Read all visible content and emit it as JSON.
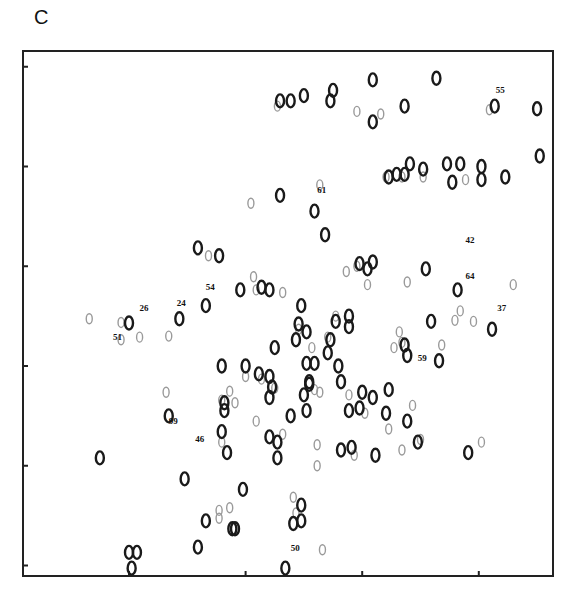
{
  "panel_label": "C",
  "chart_data": {
    "type": "scatter",
    "title": "",
    "subtitle": "2D NMR spectrum overlay (two conditions)",
    "xlabel": "",
    "ylabel": "",
    "xlim": [
      0,
      100
    ],
    "ylim": [
      0,
      100
    ],
    "x_ticks": [
      20,
      42,
      64,
      86
    ],
    "y_ticks": [
      2,
      21,
      40,
      59,
      78,
      97
    ],
    "tick_labels_shown": false,
    "grid": false,
    "legend": "none",
    "series": [
      {
        "name": "reference (dark contours)",
        "color": "#1a1a1a",
        "points": [
          [
            48.5,
            90.5
          ],
          [
            50.5,
            90.5
          ],
          [
            53,
            91.5
          ],
          [
            58.5,
            92.5
          ],
          [
            58,
            90.5
          ],
          [
            66,
            94.5
          ],
          [
            78,
            94.8
          ],
          [
            72,
            89.5
          ],
          [
            66,
            86.5
          ],
          [
            89,
            89.5
          ],
          [
            97,
            89
          ],
          [
            73,
            78.5
          ],
          [
            72,
            76.5
          ],
          [
            69,
            76
          ],
          [
            70.5,
            76.5
          ],
          [
            75.5,
            77.5
          ],
          [
            80,
            78.5
          ],
          [
            82.5,
            78.5
          ],
          [
            86.5,
            78
          ],
          [
            86.5,
            75.5
          ],
          [
            91,
            76
          ],
          [
            97.5,
            80
          ],
          [
            81,
            75
          ],
          [
            48.5,
            72.5
          ],
          [
            55,
            69.5
          ],
          [
            57,
            65
          ],
          [
            33,
            62.5
          ],
          [
            37,
            61
          ],
          [
            63.5,
            59.5
          ],
          [
            66,
            59.8
          ],
          [
            65,
            58.5
          ],
          [
            76,
            58.5
          ],
          [
            82,
            54.5
          ],
          [
            41,
            54.5
          ],
          [
            45,
            55
          ],
          [
            46.5,
            54.5
          ],
          [
            52.5,
            51.5
          ],
          [
            59,
            48.5
          ],
          [
            61.5,
            49.5
          ],
          [
            61.5,
            47.5
          ],
          [
            20,
            48.2
          ],
          [
            29.5,
            49
          ],
          [
            34.5,
            51.5
          ],
          [
            52,
            48
          ],
          [
            51.5,
            45
          ],
          [
            53.5,
            46.5
          ],
          [
            47.5,
            43.5
          ],
          [
            58,
            45
          ],
          [
            57.5,
            42.5
          ],
          [
            72,
            44
          ],
          [
            72.5,
            42
          ],
          [
            77,
            48.5
          ],
          [
            88.5,
            47
          ],
          [
            78.5,
            41
          ],
          [
            37.5,
            40
          ],
          [
            42,
            40
          ],
          [
            44.5,
            38.5
          ],
          [
            46.5,
            38
          ],
          [
            53.5,
            40.5
          ],
          [
            55,
            40.5
          ],
          [
            54,
            37
          ],
          [
            59.5,
            40
          ],
          [
            47,
            36
          ],
          [
            54,
            36.5
          ],
          [
            53,
            34.5
          ],
          [
            60,
            37
          ],
          [
            64,
            35
          ],
          [
            66,
            34
          ],
          [
            69,
            35.5
          ],
          [
            27.5,
            30.5
          ],
          [
            38,
            33
          ],
          [
            38,
            31.5
          ],
          [
            46.5,
            34
          ],
          [
            50.5,
            30.5
          ],
          [
            53.5,
            31.5
          ],
          [
            61.5,
            31.5
          ],
          [
            63.5,
            32
          ],
          [
            68.5,
            31
          ],
          [
            72.5,
            29.5
          ],
          [
            37.5,
            27.5
          ],
          [
            38.5,
            23.5
          ],
          [
            46.5,
            26.5
          ],
          [
            48,
            25.5
          ],
          [
            48,
            22.5
          ],
          [
            60,
            24
          ],
          [
            62,
            24.5
          ],
          [
            66.5,
            23
          ],
          [
            74.5,
            25.5
          ],
          [
            84,
            23.5
          ],
          [
            14.5,
            22.5
          ],
          [
            30.5,
            18.5
          ],
          [
            41.5,
            16.5
          ],
          [
            52.5,
            13.5
          ],
          [
            52.5,
            10.5
          ],
          [
            51,
            10
          ],
          [
            34.5,
            10.5
          ],
          [
            39.5,
            9
          ],
          [
            40,
            9
          ],
          [
            33,
            5.5
          ],
          [
            20,
            4.5
          ],
          [
            21.5,
            4.5
          ],
          [
            20.5,
            1.5
          ],
          [
            49.5,
            1.5
          ]
        ]
      },
      {
        "name": "comparison (light contours)",
        "color": "#9a9a9a",
        "points": [
          [
            48,
            89.5
          ],
          [
            67.5,
            88
          ],
          [
            63,
            88.5
          ],
          [
            88,
            88.8
          ],
          [
            71.5,
            76
          ],
          [
            68.5,
            76
          ],
          [
            75.5,
            76
          ],
          [
            83.5,
            75.5
          ],
          [
            43,
            71
          ],
          [
            56,
            74.5
          ],
          [
            35,
            61
          ],
          [
            63,
            59
          ],
          [
            61,
            58
          ],
          [
            72.5,
            56
          ],
          [
            43.5,
            57
          ],
          [
            44,
            54.5
          ],
          [
            49,
            54
          ],
          [
            65,
            55.5
          ],
          [
            59,
            49.5
          ],
          [
            12.5,
            49
          ],
          [
            18.5,
            45
          ],
          [
            22,
            45.5
          ],
          [
            18.5,
            48.3
          ],
          [
            27.5,
            45.7
          ],
          [
            52,
            47
          ],
          [
            54.5,
            43.5
          ],
          [
            57.5,
            45.5
          ],
          [
            70,
            43.5
          ],
          [
            71,
            46.5
          ],
          [
            71.5,
            44.5
          ],
          [
            79,
            44
          ],
          [
            81.5,
            48.7
          ],
          [
            85,
            48.5
          ],
          [
            82.5,
            50.5
          ],
          [
            92.5,
            55.5
          ],
          [
            42,
            38
          ],
          [
            45,
            37.5
          ],
          [
            55,
            35.5
          ],
          [
            27,
            35
          ],
          [
            37.5,
            33.5
          ],
          [
            39,
            35.2
          ],
          [
            40,
            33
          ],
          [
            47.5,
            35.8
          ],
          [
            56,
            35
          ],
          [
            61.5,
            34.5
          ],
          [
            64.5,
            31
          ],
          [
            69,
            28
          ],
          [
            73.5,
            32.5
          ],
          [
            71.5,
            24
          ],
          [
            75,
            26
          ],
          [
            86.5,
            25.5
          ],
          [
            37.5,
            25.5
          ],
          [
            44,
            29.5
          ],
          [
            49,
            27
          ],
          [
            55.5,
            25
          ],
          [
            55.5,
            21
          ],
          [
            62.5,
            23
          ],
          [
            51.5,
            12
          ],
          [
            51,
            15
          ],
          [
            37,
            11
          ],
          [
            37,
            12.5
          ],
          [
            39,
            13
          ],
          [
            56.5,
            5
          ]
        ]
      }
    ],
    "annotations": [
      {
        "text": "55",
        "x": 89.2,
        "y": 92.0
      },
      {
        "text": "61",
        "x": 55.5,
        "y": 73.0
      },
      {
        "text": "42",
        "x": 83.5,
        "y": 63.5
      },
      {
        "text": "64",
        "x": 83.5,
        "y": 56.5
      },
      {
        "text": "54",
        "x": 34.5,
        "y": 54.5
      },
      {
        "text": "26",
        "x": 22.0,
        "y": 50.5
      },
      {
        "text": "24",
        "x": 29.0,
        "y": 51.5
      },
      {
        "text": "51",
        "x": 17.0,
        "y": 45.0
      },
      {
        "text": "37",
        "x": 89.5,
        "y": 50.5
      },
      {
        "text": "59",
        "x": 74.5,
        "y": 41.0
      },
      {
        "text": "99",
        "x": 27.5,
        "y": 29.0
      },
      {
        "text": "46",
        "x": 32.5,
        "y": 25.5
      },
      {
        "text": "50",
        "x": 50.5,
        "y": 4.7
      }
    ]
  }
}
